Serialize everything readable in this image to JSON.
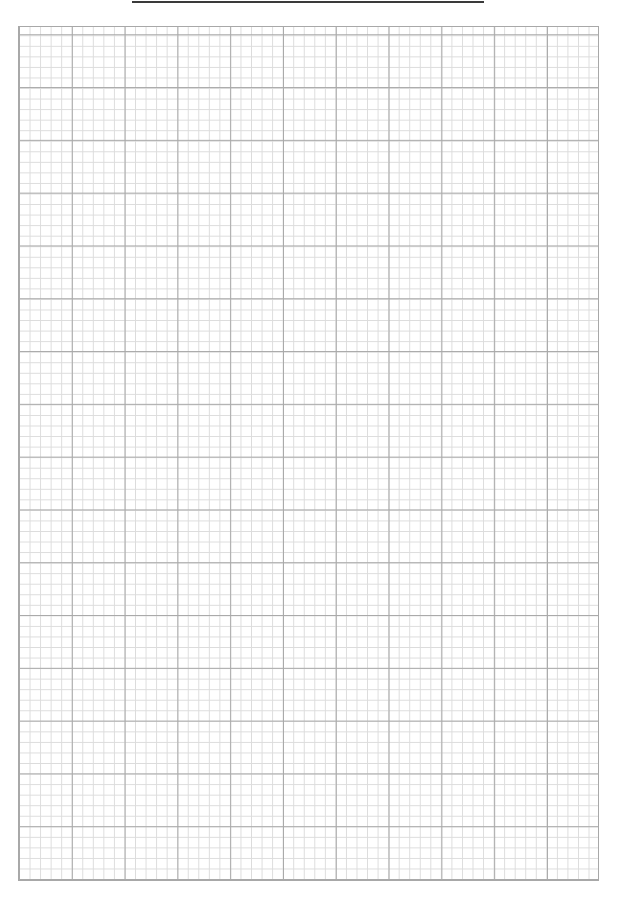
{
  "page": {
    "type": "graph-paper",
    "title_text": "",
    "title_line": {
      "present": true,
      "color": "#3a3a3a"
    },
    "grid": {
      "major_every_minor_cells": 5,
      "columns_major": 11,
      "columns_minor": 55,
      "rows_minor": 81,
      "minor_line_color": "#dcdcdc",
      "major_line_color": "#a9a9a9",
      "border_color": "#a8a8a8"
    }
  }
}
